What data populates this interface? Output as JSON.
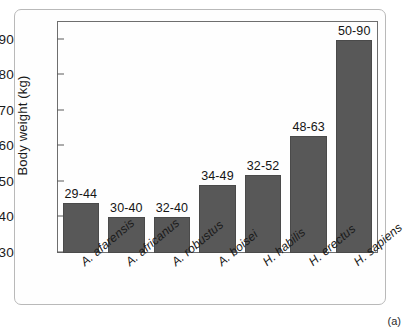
{
  "caption": "(a)",
  "chart_data": {
    "type": "bar",
    "title": "",
    "xlabel": "",
    "ylabel": "Body weight (kg)",
    "ylim": [
      30,
      95
    ],
    "yticks": [
      30,
      40,
      50,
      60,
      70,
      80,
      90
    ],
    "ytick_labels": [
      "30",
      "40",
      "50",
      "60",
      "70",
      "80",
      "90"
    ],
    "grid": false,
    "legend": "none",
    "categories": [
      "A. afarensis",
      "A. africanus",
      "A. robustus",
      "A. boisei",
      "H. habilis",
      "H. erectus",
      "H. sapiens"
    ],
    "values": [
      44,
      40,
      40,
      49,
      52,
      63,
      90
    ],
    "range_low": [
      29,
      30,
      32,
      34,
      32,
      48,
      50
    ],
    "range_high": [
      44,
      40,
      40,
      49,
      52,
      63,
      90
    ],
    "data_labels": [
      "29-44",
      "30-40",
      "32-40",
      "34-49",
      "32-52",
      "48-63",
      "50-90"
    ],
    "bar_color": "#585858",
    "axis_color": "#6e6e6e",
    "background_color": "#ffffff"
  }
}
